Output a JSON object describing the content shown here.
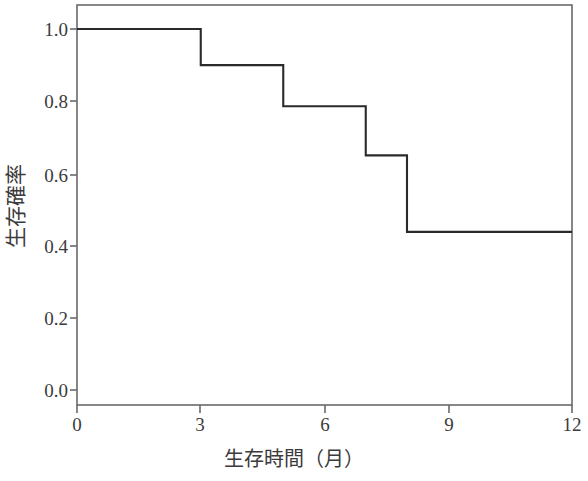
{
  "chart_data": {
    "type": "line",
    "subtype": "step-post",
    "title": "",
    "xlabel": "生存時間（月）",
    "ylabel": "生存確率",
    "xlim": [
      0,
      12
    ],
    "ylim": [
      0.0,
      1.06
    ],
    "xticks": [
      0,
      3,
      6,
      9,
      12
    ],
    "xtick_labels": [
      "0",
      "3",
      "6",
      "9",
      "12"
    ],
    "yticks": [
      0.0,
      0.2,
      0.4,
      0.6,
      0.8,
      1.0
    ],
    "ytick_labels": [
      "0.0",
      "0.2",
      "0.4",
      "0.6",
      "0.8",
      "1.0"
    ],
    "grid": false,
    "legend": false,
    "legend_position": "none",
    "line_color": "#2a2a2a",
    "line_width": 2,
    "frame_color": "#6a6a6a",
    "background": "#ffffff",
    "series": [
      {
        "name": "生存確率",
        "x": [
          0,
          3,
          5,
          7,
          8,
          12
        ],
        "y": [
          1.0,
          0.9,
          0.786,
          0.65,
          0.438,
          0.438
        ],
        "steps": [
          {
            "t_start": 0,
            "t_end": 3,
            "survival": 1.0
          },
          {
            "t_start": 3,
            "t_end": 5,
            "survival": 0.9
          },
          {
            "t_start": 5,
            "t_end": 7,
            "survival": 0.786
          },
          {
            "t_start": 7,
            "t_end": 8,
            "survival": 0.65
          },
          {
            "t_start": 8,
            "t_end": 12,
            "survival": 0.438
          }
        ],
        "event_times": [
          3,
          5,
          7,
          8
        ]
      }
    ]
  }
}
